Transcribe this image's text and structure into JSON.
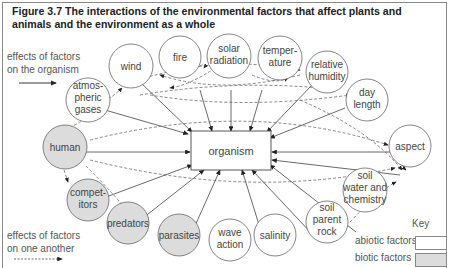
{
  "figure": {
    "title": "Figure 3.7  The interactions of the environmental factors that affect plants and animals and the environment as a whole"
  },
  "legend": {
    "solid_arrow_label": [
      "effects of factors",
      "on the organism"
    ],
    "dashed_arrow_label": [
      "effects of factors",
      "on one another"
    ],
    "key_title": "Key",
    "abiotic_label": "abiotic factors",
    "biotic_label": "biotic factors",
    "abiotic_color": "#ffffff",
    "biotic_color": "#dcdcdc"
  },
  "center": {
    "label": "organism"
  },
  "nodes": [
    {
      "id": "atmospheric-gases",
      "lines": [
        "atmos-",
        "pheric",
        "gases"
      ],
      "type": "abiotic"
    },
    {
      "id": "wind",
      "lines": [
        "wind"
      ],
      "type": "abiotic"
    },
    {
      "id": "fire",
      "lines": [
        "fire"
      ],
      "type": "abiotic"
    },
    {
      "id": "solar-radiation",
      "lines": [
        "solar",
        "radiation"
      ],
      "type": "abiotic"
    },
    {
      "id": "temperature",
      "lines": [
        "temper-",
        "ature"
      ],
      "type": "abiotic"
    },
    {
      "id": "relative-humidity",
      "lines": [
        "relative",
        "humidity"
      ],
      "type": "abiotic"
    },
    {
      "id": "day-length",
      "lines": [
        "day",
        "length"
      ],
      "type": "abiotic"
    },
    {
      "id": "aspect",
      "lines": [
        "aspect"
      ],
      "type": "abiotic"
    },
    {
      "id": "soil-water-chemistry",
      "lines": [
        "soil",
        "water and",
        "chemistry"
      ],
      "type": "abiotic"
    },
    {
      "id": "soil-parent-rock",
      "lines": [
        "soil",
        "parent",
        "rock"
      ],
      "type": "abiotic"
    },
    {
      "id": "salinity",
      "lines": [
        "salinity"
      ],
      "type": "abiotic"
    },
    {
      "id": "wave-action",
      "lines": [
        "wave",
        "action"
      ],
      "type": "abiotic"
    },
    {
      "id": "parasites",
      "lines": [
        "parasites"
      ],
      "type": "biotic"
    },
    {
      "id": "predators",
      "lines": [
        "predators"
      ],
      "type": "biotic"
    },
    {
      "id": "competitors",
      "lines": [
        "compet-",
        "itors"
      ],
      "type": "biotic"
    },
    {
      "id": "human",
      "lines": [
        "human"
      ],
      "type": "biotic"
    }
  ]
}
